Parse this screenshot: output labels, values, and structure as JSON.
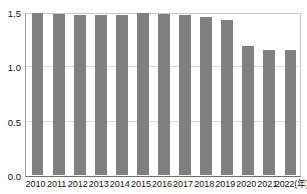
{
  "top_caption": "",
  "chart_data": {
    "type": "bar",
    "title": "",
    "xlabel": "2022(年)",
    "ylabel": "",
    "categories": [
      "2010",
      "2011",
      "2012",
      "2013",
      "2014",
      "2015",
      "2016",
      "2017",
      "2018",
      "2019",
      "2020",
      "2021",
      "2022(年)"
    ],
    "values": [
      1.49,
      1.48,
      1.47,
      1.47,
      1.47,
      1.49,
      1.48,
      1.47,
      1.45,
      1.43,
      1.19,
      1.15,
      1.15
    ],
    "ylim": [
      0.0,
      1.5
    ],
    "yticks": [
      "0.0",
      "0.5",
      "1.0",
      "1.5"
    ],
    "ytick_values": [
      0.0,
      0.5,
      1.0,
      1.5
    ],
    "grid": true,
    "legend": "none",
    "bar_color": "#808080",
    "grid_color": "#d9d9d9",
    "axis_color": "#6f6f6f"
  }
}
